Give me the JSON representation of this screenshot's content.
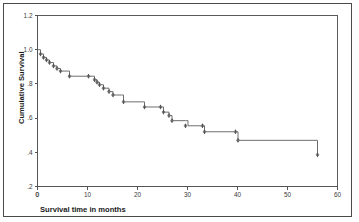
{
  "figure": {
    "background_color": "#ffffff",
    "frame_color": "#4a4a4a",
    "curve_color": "#6e6e6e"
  },
  "chart_data": {
    "type": "line",
    "subtype": "kaplan-meier-survival-step",
    "title": "",
    "subtitle": "",
    "xlabel": "Survival time in months",
    "ylabel": "Cumulative Survival",
    "xlim": [
      0,
      60
    ],
    "ylim": [
      0.2,
      1.2
    ],
    "xticks": [
      0,
      10,
      20,
      30,
      40,
      50,
      60
    ],
    "xtick_labels": [
      "0",
      "10",
      "20",
      "30",
      "40",
      "50",
      "60"
    ],
    "yticks": [
      0.2,
      0.4,
      0.6,
      0.8,
      1.0,
      1.2
    ],
    "ytick_labels": [
      ".2",
      ".4",
      ".6",
      ".8",
      "1.0",
      "1.2"
    ],
    "origin_label": "0",
    "grid": false,
    "legend": false,
    "legend_position": "none",
    "series": [
      {
        "name": "Cumulative Survival",
        "x": [
          0,
          0.6,
          1.2,
          1.8,
          2.4,
          3.2,
          3.9,
          4.6,
          6.4,
          10.2,
          11.4,
          11.9,
          12.4,
          13.2,
          14.3,
          15.1,
          16.8,
          17.2,
          21.0,
          21.4,
          24.6,
          25.2,
          26.3,
          26.9,
          29.6,
          30.1,
          33.0,
          33.4,
          39.6,
          40.1,
          56.0
        ],
        "y": [
          1.0,
          0.975,
          0.955,
          0.94,
          0.925,
          0.905,
          0.89,
          0.875,
          0.845,
          0.845,
          0.825,
          0.81,
          0.795,
          0.775,
          0.755,
          0.735,
          0.735,
          0.695,
          0.695,
          0.665,
          0.665,
          0.635,
          0.615,
          0.585,
          0.585,
          0.555,
          0.555,
          0.52,
          0.52,
          0.47,
          0.47
        ],
        "final_drop_y": 0.385,
        "censored_times": [
          0.6,
          1.2,
          1.8,
          2.4,
          3.2,
          3.9,
          4.6,
          6.4,
          10.2,
          11.4,
          11.9,
          12.4,
          13.2,
          14.3,
          15.1,
          17.2,
          21.4,
          24.6,
          25.2,
          26.3,
          26.9,
          29.6,
          33.0,
          33.4,
          39.6,
          40.1,
          56.0
        ],
        "censored_survival": [
          0.975,
          0.955,
          0.94,
          0.925,
          0.905,
          0.89,
          0.875,
          0.845,
          0.845,
          0.825,
          0.81,
          0.795,
          0.775,
          0.755,
          0.735,
          0.695,
          0.665,
          0.665,
          0.635,
          0.615,
          0.585,
          0.555,
          0.555,
          0.52,
          0.52,
          0.47,
          0.385
        ]
      }
    ],
    "annotations": []
  }
}
